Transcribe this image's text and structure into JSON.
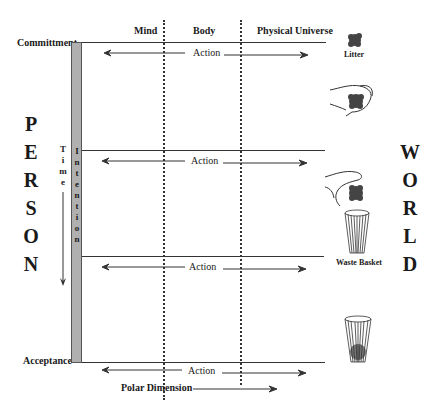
{
  "columns": [
    "Mind",
    "Body",
    "Physical Universe"
  ],
  "levels": {
    "top": "Committment",
    "bottom": "Acceptance"
  },
  "action_label": "Action",
  "action_rows": 4,
  "person_letters": [
    "P",
    "E",
    "R",
    "S",
    "O",
    "N"
  ],
  "world_letters": [
    "W",
    "O",
    "R",
    "L",
    "D"
  ],
  "time_letters": [
    "T",
    "i",
    "m",
    "e"
  ],
  "intention_letters": [
    "I",
    "n",
    "t",
    "e",
    "n",
    "t",
    "i",
    "o",
    "n"
  ],
  "objects": {
    "litter": "Litter",
    "waste_basket": "Waste Basket"
  },
  "polar_dimension": "Polar Dimension",
  "colors": {
    "line": "#333333",
    "bar_fill": "#b0b0b0",
    "litter": "#444444"
  }
}
